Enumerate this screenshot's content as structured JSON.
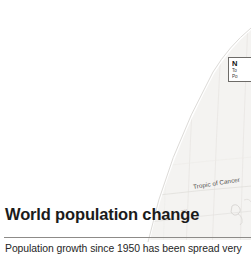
{
  "page": {
    "background_color": "#ffffff",
    "width": 251,
    "height": 258
  },
  "article": {
    "headline": "World population change",
    "standfirst": "Population growth since 1950 has been spread very",
    "rule_color": "#8d8b88",
    "headline_color": "#1b1b1b",
    "standfirst_color": "#262626"
  },
  "callout": {
    "title": "N",
    "line1": "To",
    "line2": "Po",
    "border_color": "#6d6b68",
    "background_color": "#ffffff"
  },
  "map": {
    "labels": {
      "tropic_of_cancer": "Tropic of Cancer",
      "latitude_20": "20°"
    },
    "graticule_color": "#e2e0dd",
    "landmass_color": "#f3f2f0",
    "edge_color": "#d8d6d3"
  }
}
